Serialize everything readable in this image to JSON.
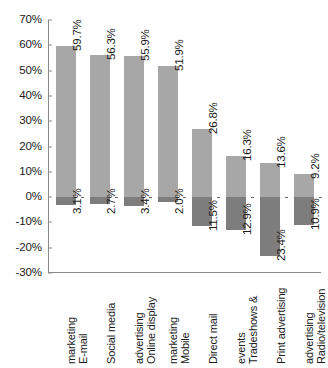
{
  "chart_data": {
    "type": "bar",
    "title": "",
    "subtitle": "",
    "xlabel": "",
    "ylabel": "",
    "ylim": [
      -30,
      70
    ],
    "ytick_step": 10,
    "grid": false,
    "legend": "none",
    "orientation": "vertical",
    "stacked_about_zero": true,
    "ytick_labels": [
      "70%",
      "60%",
      "50%",
      "40%",
      "30%",
      "20%",
      "10%",
      "0%",
      "-10%",
      "-20%",
      "-30%"
    ],
    "ytick_values": [
      70,
      60,
      50,
      40,
      30,
      20,
      10,
      0,
      -10,
      -20,
      -30
    ],
    "categories": [
      "E-mail\nmarketing",
      "Social media",
      "Online display\nadvertising",
      "Mobile\nmarketing",
      "Direct mail",
      "Tradeshows &\nevents",
      "Print advertising",
      "Radio/television\nadvertising"
    ],
    "series": [
      {
        "name": "positive",
        "color": "#a7a7a7",
        "values": [
          59.7,
          56.3,
          55.9,
          51.9,
          26.8,
          16.3,
          13.6,
          9.2
        ],
        "labels": [
          "59.7%",
          "56.3%",
          "55.9%",
          "51.9%",
          "26.8%",
          "16.3%",
          "13.6%",
          "9.2%"
        ]
      },
      {
        "name": "negative",
        "color": "#7d7d7d",
        "values": [
          -3.1,
          -2.7,
          -3.4,
          -2.0,
          -11.5,
          -12.9,
          -23.4,
          -10.9
        ],
        "labels": [
          "3.1%",
          "2.7%",
          "3.4%",
          "2.0%",
          "11.5%",
          "12.9%",
          "23.4%",
          "10.9%"
        ]
      }
    ],
    "colors": {
      "positive_bar": "#a7a7a7",
      "negative_bar": "#7d7d7d",
      "axis": "#8a8a8a",
      "text": "#1a1a1a",
      "background": "#ffffff"
    }
  }
}
